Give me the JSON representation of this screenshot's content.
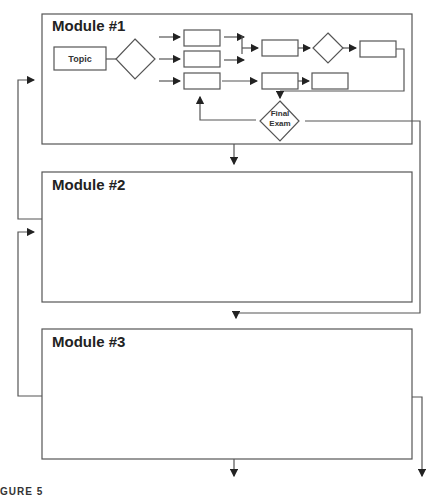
{
  "modules": [
    {
      "title": "Module #1"
    },
    {
      "title": "Module #2"
    },
    {
      "title": "Module #3"
    }
  ],
  "module1": {
    "topic_label": "Topic",
    "final_exam_label_line1": "Final",
    "final_exam_label_line2": "Exam"
  },
  "caption": "GURE 5"
}
